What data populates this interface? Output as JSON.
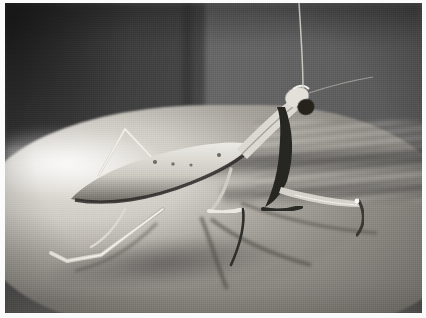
{
  "image": {
    "title": "Praying mantis on a human hand",
    "medium": "black-and-white photograph",
    "orientation": "landscape",
    "border": {
      "style": "white photographic margin",
      "color": "#fbfbfb",
      "left_px": 5,
      "top_px": 3,
      "right_px": 4,
      "bottom_px": 5
    },
    "palette": {
      "background_dark": "#3a3a3a",
      "background_panel": "#6a6a6a",
      "skin_highlight": "#e8e5df",
      "skin_midtone": "#b0ada6",
      "skin_shadow": "#6a6760",
      "mantis_body": "#d8d5ce",
      "mantis_dark_marking": "#2b2b2b",
      "eye": "#1c1c1c"
    }
  },
  "scene": {
    "subject": "praying mantis",
    "surface": "back of a human hand / forearm",
    "lighting": "strong directional light from the left, deep shadows cast to the lower right",
    "background_description": "out-of-focus grey wall with a vertical edge, darker at the left, lighter panel at the right",
    "grain": "heavy film grain / halftone texture"
  },
  "subject_parts": [
    {
      "name": "head",
      "description": "triangular head turned toward the camera with one large dark compound eye"
    },
    {
      "name": "antenna",
      "description": "thin pale antenna rising from the head to the top edge of the frame"
    },
    {
      "name": "pronotum",
      "description": "long slender neck segment angled down-left from the head"
    },
    {
      "name": "abdomen",
      "description": "broad pale tapering abdomen resting along the hand, dark shaded lower edge"
    },
    {
      "name": "raptorial-foreleg-near",
      "description": "dark folded grasping front leg below the head"
    },
    {
      "name": "raptorial-foreleg-far",
      "description": "pale front leg extended to the right with the tarsus bent downward"
    },
    {
      "name": "middle-leg",
      "description": "pale middle leg bent downward onto the hand, casting a shadow"
    },
    {
      "name": "hind-leg-raised",
      "description": "hind leg raised in an inverted-V above the abdomen"
    },
    {
      "name": "hind-leg-trailing",
      "description": "long hind leg trailing to the lower left, foot hooked onto the skin"
    }
  ],
  "annotations": {
    "caption": "",
    "labels": []
  }
}
